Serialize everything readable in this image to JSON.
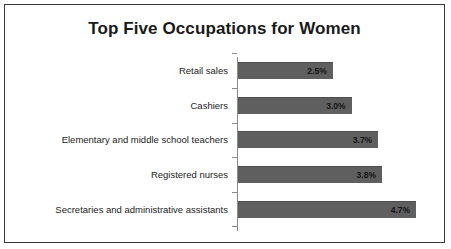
{
  "chart_data": {
    "type": "bar",
    "orientation": "horizontal",
    "title": "Top Five Occupations for Women",
    "xlabel": "",
    "ylabel": "",
    "xlim": [
      0,
      5.2
    ],
    "grid": false,
    "legend": false,
    "value_suffix": "%",
    "categories": [
      "Retail sales",
      "Cashiers",
      "Elementary and middle school teachers",
      "Registered nurses",
      "Secretaries and administrative assistants"
    ],
    "values": [
      2.5,
      3.0,
      3.7,
      3.8,
      4.7
    ],
    "labels": [
      "2.5%",
      "3.0%",
      "3.7%",
      "3.8%",
      "4.7%"
    ],
    "bar_color": "#5f5f5f",
    "axis_color": "#8a8a8a",
    "border_color": "#3a3a3a",
    "background": "#ffffff"
  }
}
